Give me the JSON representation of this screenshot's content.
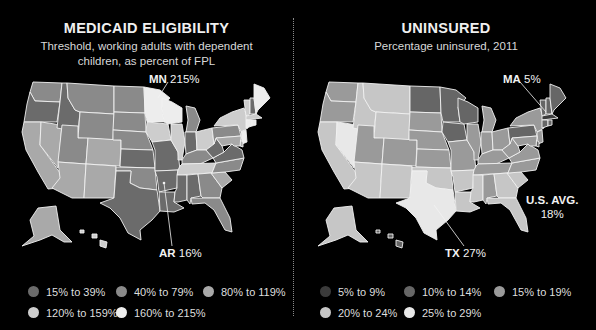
{
  "left": {
    "title": "MEDICAID ELIGIBILITY",
    "subtitle_line1": "Threshold, working adults with dependent",
    "subtitle_line2": "children, as percent of FPL",
    "callouts": [
      {
        "state": "MN",
        "value": "215%"
      },
      {
        "state": "AR",
        "value": "16%"
      }
    ],
    "legend": [
      {
        "label": "15% to 39%",
        "color": "#6b6b6b"
      },
      {
        "label": "40% to 79%",
        "color": "#8a8a8a"
      },
      {
        "label": "80% to 119%",
        "color": "#a9a9a9"
      },
      {
        "label": "120% to 159%",
        "color": "#cdcdcd"
      },
      {
        "label": "160% to 215%",
        "color": "#ededed"
      }
    ]
  },
  "right": {
    "title": "UNINSURED",
    "subtitle_line1": "Percentage uninsured, 2011",
    "callouts": [
      {
        "state": "MA",
        "value": "5%"
      },
      {
        "state": "TX",
        "value": "27%"
      },
      {
        "state": "U.S. AVG.",
        "value": "18%"
      }
    ],
    "legend": [
      {
        "label": "5% to 9%",
        "color": "#3b3b3b"
      },
      {
        "label": "10% to 14%",
        "color": "#666666"
      },
      {
        "label": "15% to 19%",
        "color": "#9a9a9a"
      },
      {
        "label": "20% to 24%",
        "color": "#c6c6c6"
      },
      {
        "label": "25% to 29%",
        "color": "#e8e8e8"
      }
    ]
  },
  "chart_data": [
    {
      "type": "choropleth",
      "title": "MEDICAID ELIGIBILITY",
      "subtitle": "Threshold, working adults with dependent children, as percent of FPL",
      "legend_placement": "bottom",
      "bins": [
        "15% to 39%",
        "40% to 79%",
        "80% to 119%",
        "120% to 159%",
        "160% to 215%"
      ],
      "annotations": [
        {
          "state": "MN",
          "value": "215%"
        },
        {
          "state": "AR",
          "value": "16%"
        }
      ],
      "state_bin": {
        "WA": 1,
        "OR": 0,
        "CA": 2,
        "NV": 2,
        "ID": 0,
        "MT": 1,
        "WY": 1,
        "UT": 1,
        "AZ": 2,
        "CO": 2,
        "NM": 2,
        "ND": 1,
        "SD": 1,
        "NE": 1,
        "KS": 0,
        "OK": 1,
        "TX": 0,
        "MN": 4,
        "IA": 3,
        "MO": 0,
        "AR": 0,
        "LA": 0,
        "WI": 4,
        "IL": 3,
        "MI": 1,
        "IN": 0,
        "OH": 3,
        "KY": 1,
        "TN": 3,
        "MS": 0,
        "AL": 0,
        "GA": 1,
        "FL": 1,
        "SC": 2,
        "NC": 1,
        "VA": 0,
        "WV": 0,
        "PA": 1,
        "NY": 3,
        "VT": 3,
        "NH": 0,
        "ME": 4,
        "MA": 3,
        "CT": 4,
        "RI": 4,
        "NJ": 4,
        "DE": 2,
        "MD": 2,
        "AK": 2,
        "HI": 3
      }
    },
    {
      "type": "choropleth",
      "title": "UNINSURED",
      "subtitle": "Percentage uninsured, 2011",
      "legend_placement": "bottom",
      "bins": [
        "5% to 9%",
        "10% to 14%",
        "15% to 19%",
        "20% to 24%",
        "25% to 29%"
      ],
      "annotations": [
        {
          "state": "MA",
          "value": "5%"
        },
        {
          "state": "TX",
          "value": "27%"
        },
        {
          "state": "U.S. AVG.",
          "value": "18%"
        }
      ],
      "state_bin": {
        "WA": 2,
        "OR": 2,
        "CA": 3,
        "NV": 4,
        "ID": 3,
        "MT": 3,
        "WY": 3,
        "UT": 2,
        "AZ": 3,
        "CO": 2,
        "NM": 3,
        "ND": 1,
        "SD": 2,
        "NE": 2,
        "KS": 2,
        "OK": 3,
        "TX": 4,
        "MN": 1,
        "IA": 1,
        "MO": 2,
        "AR": 3,
        "LA": 3,
        "WI": 1,
        "IL": 2,
        "MI": 2,
        "IN": 2,
        "OH": 2,
        "KY": 2,
        "TN": 2,
        "MS": 3,
        "AL": 2,
        "GA": 3,
        "FL": 3,
        "SC": 3,
        "NC": 2,
        "VA": 2,
        "WV": 2,
        "PA": 1,
        "NY": 2,
        "VT": 1,
        "NH": 1,
        "ME": 1,
        "MA": 0,
        "CT": 1,
        "RI": 1,
        "NJ": 2,
        "DE": 1,
        "MD": 2,
        "AK": 3,
        "HI": 1
      }
    }
  ]
}
